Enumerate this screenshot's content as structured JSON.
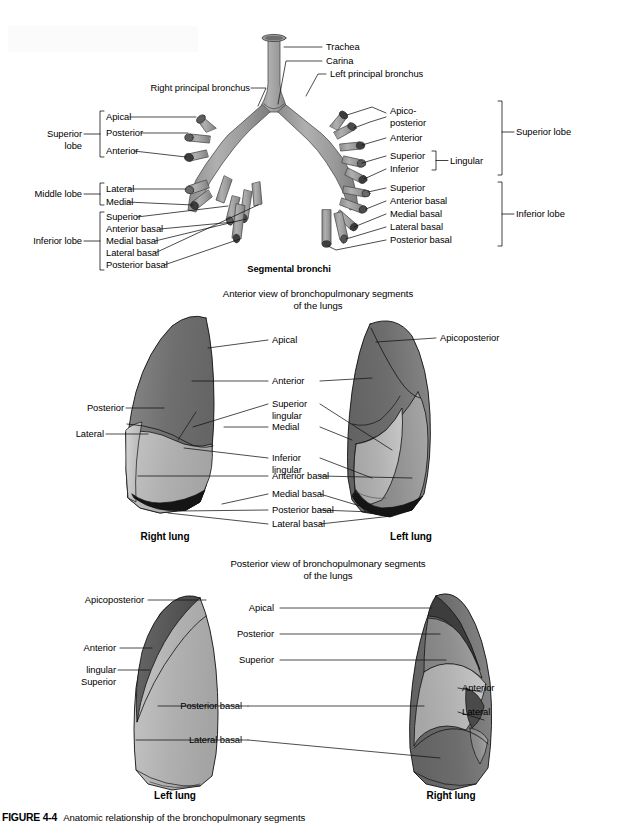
{
  "figure": {
    "caption_number": "FIGURE 4-4",
    "caption_text": "Anatomic relationship of the bronchopulmonary segments"
  },
  "panel1": {
    "title": "Segmental bronchi",
    "labels": {
      "trachea": "Trachea",
      "carina": "Carina",
      "right_principal_bronchus": "Right principal bronchus",
      "left_principal_bronchus": "Left principal bronchus"
    },
    "right_lung_groups": [
      {
        "group": "Superior\nlobe",
        "group_line1": "Superior",
        "group_line2": "lobe",
        "segments": [
          "Apical",
          "Posterior",
          "Anterior"
        ]
      },
      {
        "group": "Middle lobe",
        "group_line1": "Middle lobe",
        "group_line2": "",
        "segments": [
          "Lateral",
          "Medial"
        ]
      },
      {
        "group": "Inferior lobe",
        "group_line1": "Inferior lobe",
        "group_line2": "",
        "segments": [
          "Superior",
          "Anterior basal",
          "Medial basal",
          "Lateral basal",
          "Posterior basal"
        ]
      }
    ],
    "left_lung_groups": [
      {
        "group": "Superior lobe",
        "segments": [
          "Apico-\nposterior",
          "Anterior",
          "Superior",
          "Inferior"
        ],
        "sub_bracket": "Lingular",
        "apico_line1": "Apico-",
        "apico_line2": "posterior",
        "anterior": "Anterior",
        "lingular_superior": "Superior",
        "lingular_inferior": "Inferior"
      },
      {
        "group": "Inferior lobe",
        "segments": [
          "Superior",
          "Anterior basal",
          "Medial basal",
          "Lateral basal",
          "Posterior basal"
        ]
      }
    ]
  },
  "panel2": {
    "heading_line1": "Anterior view of bronchopulmonary segments",
    "heading_line2": "of the lungs",
    "right_lung_name": "Right lung",
    "left_lung_name": "Left lung",
    "left_labels": [
      "Posterior",
      "Lateral"
    ],
    "right_labels": [
      "Apical",
      "Anterior",
      "Superior\nlingular",
      "Medial",
      "Inferior\nlingular",
      "Anterior basal",
      "Medial basal",
      "Posterior basal",
      "Lateral basal"
    ],
    "label_apical": "Apical",
    "label_anterior": "Anterior",
    "label_superior_lingular_1": "Superior",
    "label_superior_lingular_2": "lingular",
    "label_medial": "Medial",
    "label_inferior_lingular_1": "Inferior",
    "label_inferior_lingular_2": "lingular",
    "label_anterior_basal": "Anterior basal",
    "label_medial_basal": "Medial basal",
    "label_posterior_basal": "Posterior basal",
    "label_lateral_basal": "Lateral basal",
    "label_posterior": "Posterior",
    "label_lateral": "Lateral",
    "far_right_label": "Apicoposterior"
  },
  "panel3": {
    "heading_line1": "Posterior view of bronchopulmonary segments",
    "heading_line2": "of the lungs",
    "left_lung_name": "Left lung",
    "right_lung_name": "Right lung",
    "label_apicoposterior": "Apicoposterior",
    "label_anterior_left": "Anterior",
    "label_superior_lingular_1": "Superior",
    "label_superior_lingular_2": "lingular",
    "label_apical": "Apical",
    "label_posterior": "Posterior",
    "label_superior": "Superior",
    "label_posterior_basal": "Posterior basal",
    "label_lateral_basal": "Lateral basal",
    "label_anterior_right": "Anterior",
    "label_lateral_right": "Lateral"
  },
  "colors": {
    "bronchi_fill": "#9a9a9a",
    "bronchi_stroke": "#4a4a4a",
    "seg_darkest": "#4f4f4f",
    "seg_dark": "#6e6e6e",
    "seg_mid": "#8d8d8d",
    "seg_light": "#b3b3b3",
    "seg_lightest": "#c9c9c9",
    "seg_black": "#1a1a1a",
    "leader": "#000000",
    "background": "#ffffff"
  }
}
